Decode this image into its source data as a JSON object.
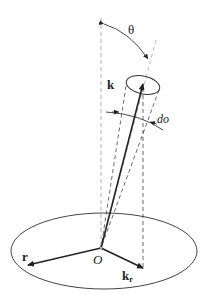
{
  "diagram": {
    "labels": {
      "theta": "θ",
      "k": "k",
      "do": "do",
      "r": "r",
      "origin": "O",
      "kr_main": "k",
      "kr_sub": "r"
    },
    "colors": {
      "line": "#222222",
      "dashed": "#888888",
      "background": "#ffffff"
    }
  }
}
